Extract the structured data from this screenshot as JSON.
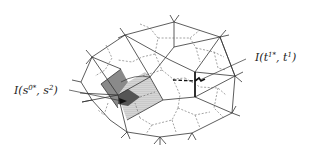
{
  "figure": {
    "labels": {
      "left": {
        "prefix": "I(s",
        "sup1": "0*",
        "mid": ", s",
        "sup2": "2",
        "suffix": ")"
      },
      "right": {
        "prefix": "I(t",
        "sup1": "1*",
        "mid": ", t",
        "sup2": "1",
        "suffix": ")"
      }
    },
    "colors": {
      "primal_edge": "#333333",
      "dual_edge": "#666666",
      "dark_shade": "#7d7d7d",
      "darker_shade": "#4a4a4a",
      "dotted_fill": "#d9d9d9",
      "background": "#ffffff"
    }
  }
}
